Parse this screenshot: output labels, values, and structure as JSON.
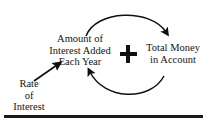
{
  "diagram": {
    "type": "causal-loop-diagram",
    "background_color": "#ffffff",
    "ink_color": "#111111",
    "nodes": [
      {
        "id": "interest-added",
        "lines": [
          "Amount of",
          "Interest Added",
          "Each Year"
        ]
      },
      {
        "id": "total-money",
        "lines": [
          "Total Money",
          "in Account"
        ]
      },
      {
        "id": "rate-of-interest",
        "lines": [
          "Rate",
          "of",
          "Interest"
        ]
      }
    ],
    "symbols": {
      "plus_sign": "+"
    },
    "connectors": [
      {
        "id": "top-arc",
        "from": "interest-added",
        "to": "total-money",
        "shape": "arc",
        "direction": "clockwise-over-top"
      },
      {
        "id": "bottom-arc",
        "from": "total-money",
        "to": "interest-added",
        "shape": "arc",
        "direction": "clockwise-under-bottom"
      },
      {
        "id": "rate-arrow",
        "from": "rate-of-interest",
        "to": "interest-added",
        "shape": "straight",
        "direction": "up-right"
      }
    ],
    "rule": {
      "id": "bottom-rule",
      "color": "#1a1a1a"
    }
  },
  "text": {
    "interest_added": {
      "line1": "Amount of",
      "line2": "Interest Added",
      "line3": "Each Year"
    },
    "total_money": {
      "line1": "Total Money",
      "line2": "in Account"
    },
    "rate_of_interest": {
      "line1": "Rate",
      "line2": "of",
      "line3": "Interest"
    },
    "plus": "+"
  }
}
